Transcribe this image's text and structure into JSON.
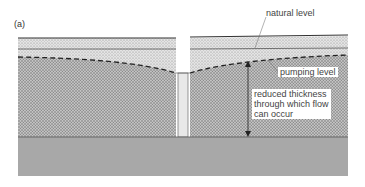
{
  "figure": {
    "panel_label": "(a)",
    "labels": {
      "natural_level": "natural level",
      "pumping_level": "pumping level",
      "reduced_thickness_line1": "reduced thickness",
      "reduced_thickness_line2": "through which flow",
      "reduced_thickness_line3": "can occur"
    },
    "colors": {
      "upper_stipple": "#d9d9d9",
      "lower_stipple": "#b8b8b8",
      "bedrock": "#a6a6a6",
      "well_casing": "#e6e6e6",
      "lines": "#333333"
    }
  }
}
